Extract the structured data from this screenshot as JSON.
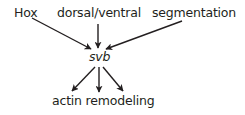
{
  "diagram": {
    "type": "regulatory-pathway",
    "nodes": {
      "hox": {
        "label": "Hox"
      },
      "dv": {
        "label": "dorsal/ventral"
      },
      "seg": {
        "label": "segmentation"
      },
      "svb": {
        "label": "svb"
      },
      "actin": {
        "label": "actin remodeling"
      }
    },
    "edges": [
      {
        "from": "Hox",
        "to": "svb"
      },
      {
        "from": "dorsal/ventral",
        "to": "svb"
      },
      {
        "from": "segmentation",
        "to": "svb"
      },
      {
        "from": "svb",
        "to": "actin remodeling"
      },
      {
        "from": "svb",
        "to": "actin remodeling"
      },
      {
        "from": "svb",
        "to": "actin remodeling"
      }
    ],
    "colors": {
      "ink": "#231f20",
      "background": "#ffffff"
    }
  }
}
